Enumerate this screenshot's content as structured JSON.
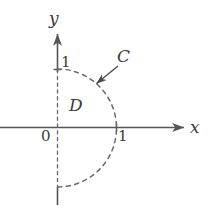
{
  "figure": {
    "type": "diagram",
    "background_color": "#ffffff",
    "axis_color": "#55555a",
    "curve_color": "#6a6a70",
    "label_color": "#3a3a3a",
    "axes": {
      "x_axis_label": "x",
      "y_axis_label": "y",
      "origin_label": "0",
      "x_tick_label": "1",
      "y_tick_label": "1"
    },
    "annotations": {
      "curve_label": "C",
      "region_label": "D"
    },
    "geometry": {
      "origin_px": [
        57,
        128
      ],
      "radius_px": 59,
      "x_axis_span_px": [
        0,
        188
      ],
      "y_axis_top_px": 30,
      "y_axis_bottom_px": 205,
      "arc_start_deg": 90,
      "arc_end_deg": -90,
      "arrow_from_px": [
        118,
        66
      ],
      "arrow_to_px": [
        95,
        84
      ]
    }
  }
}
